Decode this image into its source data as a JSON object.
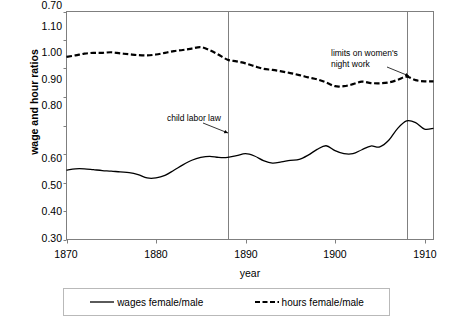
{
  "chart_data": {
    "type": "line",
    "title": "",
    "xlabel": "year",
    "ylabel": "wage and hour ratios",
    "xlim": [
      1870,
      1911
    ],
    "ylim": [
      0.3,
      1.1
    ],
    "grid": false,
    "legend_position": "bottom",
    "y_ticks": [
      "1.10",
      "1.00",
      "0.90",
      "0.80",
      "0.70",
      "0.60",
      "0.50",
      "0.40",
      "0.30"
    ],
    "y_tick_values": [
      1.1,
      1.0,
      0.9,
      0.8,
      0.7,
      0.6,
      0.5,
      0.4,
      0.3
    ],
    "x_ticks": [
      "1870",
      "1880",
      "1890",
      "1900",
      "1910"
    ],
    "x_tick_values": [
      1870,
      1880,
      1890,
      1900,
      1910
    ],
    "x": [
      1870,
      1871,
      1872,
      1873,
      1874,
      1875,
      1876,
      1877,
      1878,
      1879,
      1880,
      1881,
      1882,
      1883,
      1884,
      1885,
      1886,
      1887,
      1888,
      1889,
      1890,
      1891,
      1892,
      1893,
      1894,
      1895,
      1896,
      1897,
      1898,
      1899,
      1900,
      1901,
      1902,
      1903,
      1904,
      1905,
      1906,
      1907,
      1908,
      1909,
      1910,
      1911
    ],
    "series": [
      {
        "name": "wages female/male",
        "style": "solid",
        "color": "#000000",
        "values": [
          0.543,
          0.548,
          0.548,
          0.545,
          0.542,
          0.54,
          0.537,
          0.535,
          0.528,
          0.516,
          0.516,
          0.525,
          0.543,
          0.562,
          0.578,
          0.588,
          0.592,
          0.588,
          0.588,
          0.594,
          0.601,
          0.593,
          0.577,
          0.568,
          0.572,
          0.578,
          0.581,
          0.596,
          0.616,
          0.629,
          0.612,
          0.601,
          0.601,
          0.615,
          0.628,
          0.625,
          0.648,
          0.69,
          0.716,
          0.71,
          0.687,
          0.69
        ]
      },
      {
        "name": "hours female/male",
        "style": "dashed",
        "color": "#000000",
        "values": [
          0.941,
          0.946,
          0.952,
          0.955,
          0.955,
          0.957,
          0.953,
          0.95,
          0.947,
          0.946,
          0.949,
          0.955,
          0.961,
          0.965,
          0.97,
          0.975,
          0.964,
          0.948,
          0.931,
          0.925,
          0.918,
          0.908,
          0.899,
          0.895,
          0.89,
          0.884,
          0.877,
          0.869,
          0.862,
          0.851,
          0.838,
          0.838,
          0.845,
          0.854,
          0.849,
          0.848,
          0.851,
          0.86,
          0.871,
          0.859,
          0.855,
          0.855
        ]
      }
    ],
    "annotations": [
      {
        "id": "child-labor-law",
        "text": "child labor law",
        "text_x": 167,
        "text_y": 113,
        "arrow_from_x": 203,
        "arrow_from_y": 123,
        "arrow_to_x": 228,
        "arrow_to_y": 133,
        "marker_year": 1888
      },
      {
        "id": "limits-on-womens-night-work",
        "text_line1": "limits on women's",
        "text_line2": "night work",
        "text_x": 331,
        "text_y": 48,
        "arrow_from_x": 387,
        "arrow_from_y": 67,
        "arrow_to_x": 409,
        "arrow_to_y": 76,
        "marker_year": 1908
      }
    ],
    "vertical_markers": [
      {
        "id": "child-labor-law-line",
        "year": 1888
      },
      {
        "id": "night-work-line",
        "year": 1908
      }
    ]
  },
  "legend": {
    "entries": [
      {
        "label": "wages female/male",
        "style": "solid"
      },
      {
        "label": "hours female/male",
        "style": "dashed"
      }
    ]
  },
  "colors": {
    "line": "#000000",
    "axis": "#7f7f7f",
    "marker_line": "#808080",
    "legend_border": "#b9b9b9",
    "background": "#ffffff"
  }
}
